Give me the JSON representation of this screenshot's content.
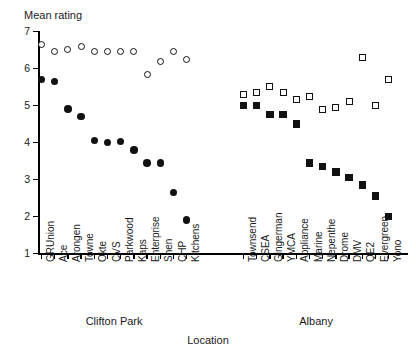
{
  "chart_data": {
    "type": "scatter",
    "title": "",
    "ylabel": "Mean rating",
    "xlabel": "Location",
    "ylim": [
      1,
      7
    ],
    "yticks": [
      1,
      2,
      3,
      4,
      5,
      6,
      7
    ],
    "ytick_labels": [
      "1",
      "2",
      "3",
      "4",
      "5",
      "6",
      "7"
    ],
    "grid": false,
    "legend": "none",
    "groups": [
      {
        "name": "Clifton Park",
        "categories": [
          "GRUnion",
          "Ace",
          "Arongen",
          "Towne",
          "Okte",
          "CVS",
          "Parkwood",
          "Kaps",
          "Enterprise",
          "Shen",
          "CHP",
          "Kitchens"
        ],
        "series": [
          {
            "name": "open-circle",
            "marker": "circle-open",
            "values": [
              6.65,
              6.45,
              6.5,
              6.6,
              6.45,
              6.45,
              6.45,
              6.45,
              5.85,
              6.2,
              6.45,
              6.25
            ]
          },
          {
            "name": "filled-circle",
            "marker": "circle-filled",
            "values": [
              5.7,
              5.65,
              4.9,
              4.7,
              4.05,
              4.0,
              4.02,
              3.8,
              3.45,
              3.45,
              2.65,
              1.9
            ]
          }
        ]
      },
      {
        "name": "Albany",
        "categories": [
          "Townsend",
          "CSEA",
          "Gingerman",
          "YMCA",
          "Appliance",
          "Marine",
          "Nepenthe",
          "Drome",
          "DMV",
          "QE2",
          "Evergreen",
          "Yono"
        ],
        "series": [
          {
            "name": "open-square",
            "marker": "square-open",
            "values": [
              5.3,
              5.35,
              5.5,
              5.35,
              5.15,
              5.25,
              4.9,
              4.95,
              5.1,
              6.3,
              5.0,
              5.7
            ]
          },
          {
            "name": "filled-square",
            "marker": "square-filled",
            "values": [
              5.0,
              5.0,
              4.75,
              4.75,
              4.5,
              3.45,
              3.35,
              3.2,
              3.05,
              2.85,
              2.55,
              2.0
            ]
          }
        ]
      }
    ]
  },
  "axes": {
    "y_title": "Mean rating",
    "x_title": "Location"
  }
}
